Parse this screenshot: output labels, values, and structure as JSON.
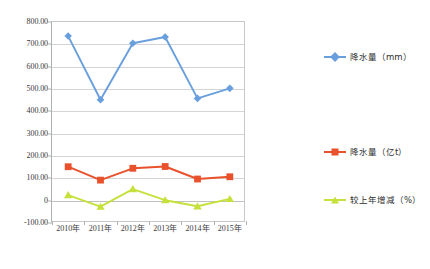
{
  "chart_data": {
    "type": "line",
    "title": "",
    "subtitle": "",
    "xlabel": "",
    "ylabel": "",
    "categories": [
      "2010年",
      "2011年",
      "2012年",
      "2013年",
      "2014年",
      "2015年"
    ],
    "ylim": [
      -100,
      800
    ],
    "ytick_step": 100,
    "ytick_labels": [
      "800.00",
      "700.00",
      "600.00",
      "500.00",
      "400.00",
      "300.00",
      "200.00",
      "100.00",
      "0",
      "-100.00"
    ],
    "ytick_values": [
      800,
      700,
      600,
      500,
      400,
      300,
      200,
      100,
      0,
      -100
    ],
    "grid": true,
    "legend_position": "right",
    "series": [
      {
        "name": "降水量（mm）",
        "color": "#6a9fdd",
        "marker": "diamond",
        "values": [
          737,
          452,
          705,
          733,
          458,
          503
        ]
      },
      {
        "name": "降水量（亿t）",
        "color": "#e8512b",
        "marker": "square",
        "values": [
          152,
          92,
          145,
          153,
          97,
          107
        ]
      },
      {
        "name": "较上年增减（%）",
        "color": "#c6e03c",
        "marker": "triangle",
        "values": [
          25,
          -27,
          52,
          2,
          -25,
          8
        ]
      }
    ]
  },
  "caption": ""
}
